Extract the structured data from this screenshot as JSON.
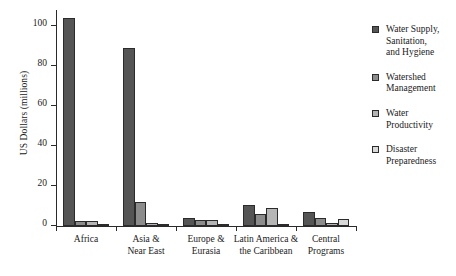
{
  "chart_data": {
    "type": "bar",
    "title": "",
    "xlabel": "",
    "ylabel": "US Dollars (millions)",
    "ylim": [
      0,
      108
    ],
    "yticks": [
      0,
      20,
      40,
      60,
      80,
      100
    ],
    "ytick_labels": [
      "0",
      "20",
      "40",
      "60",
      "80",
      "100"
    ],
    "grid": false,
    "legend_position": "right",
    "categories": [
      "Africa",
      "Asia &\nNear East",
      "Europe &\nEurasia",
      "Latin America &\nthe Caribbean",
      "Central\nPrograms"
    ],
    "category_lines": [
      [
        "Africa"
      ],
      [
        "Asia &",
        "Near East"
      ],
      [
        "Europe &",
        "Eurasia"
      ],
      [
        "Latin America &",
        "the Caribbean"
      ],
      [
        "Central",
        "Programs"
      ]
    ],
    "series": [
      {
        "name": "Water Supply, Sanitation, and Hygiene",
        "legend_lines": [
          "Water Supply,",
          "Sanitation,",
          "and Hygiene"
        ],
        "color": "#555555",
        "values": [
          104,
          89,
          4.0,
          10.5,
          7.0
        ]
      },
      {
        "name": "Watershed Management",
        "legend_lines": [
          "Watershed",
          "Management"
        ],
        "color": "#8c8c8c",
        "values": [
          2.5,
          12.0,
          3.0,
          6.0,
          4.2
        ]
      },
      {
        "name": "Water Productivity",
        "legend_lines": [
          "Water",
          "Productivity"
        ],
        "color": "#b5b5b5",
        "values": [
          2.6,
          1.6,
          3.0,
          9.0,
          1.6
        ]
      },
      {
        "name": "Disaster Preparedness",
        "legend_lines": [
          "Disaster",
          "Preparedness"
        ],
        "color": "#d9d9d9",
        "values": [
          0.8,
          0.4,
          0.2,
          0.3,
          3.6
        ]
      }
    ]
  }
}
